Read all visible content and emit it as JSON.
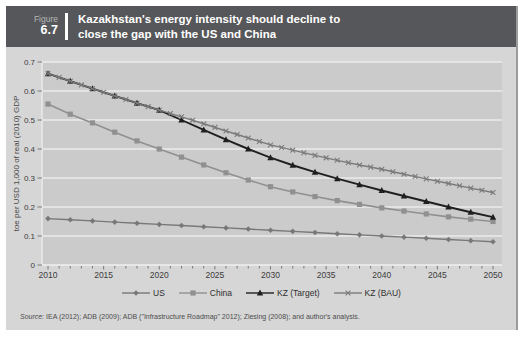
{
  "header": {
    "figure_label": "Figure",
    "figure_number": "6.7",
    "title_line1": "Kazakhstan's energy intensity should decline to",
    "title_line2": "close the gap with the US and China",
    "header_bg": "#56575a"
  },
  "source_note": {
    "prefix": "Source:",
    "text": " IEA (2012); ADB (2009); ADB (\"Infrastructure Roadmap\" 2012); Ziesing (2008); and author's analysis."
  },
  "colors": {
    "body_bg": "#d6d6d6",
    "plot_bg": "#cbcbcb",
    "gridline": "#ebebeb",
    "axis_line": "#efefef",
    "tick_mark": "#6f6f6f"
  },
  "chart_data": {
    "type": "line",
    "title": "Kazakhstan's energy intensity should decline to close the gap with the US and China",
    "xlabel": "",
    "ylabel": "toe per  USD 1,000 of real (2010) GDP",
    "xlim": [
      2010,
      2050
    ],
    "ylim": [
      0,
      0.7
    ],
    "x_ticks": [
      2010,
      2015,
      2020,
      2025,
      2030,
      2035,
      2040,
      2045,
      2050
    ],
    "y_ticks": [
      0,
      0.1,
      0.2,
      0.3,
      0.4,
      0.5,
      0.6,
      0.7
    ],
    "grid": "horizontal",
    "legend_position": "bottom",
    "x": [
      2010,
      2012,
      2014,
      2016,
      2018,
      2020,
      2022,
      2024,
      2026,
      2028,
      2030,
      2032,
      2034,
      2036,
      2038,
      2040,
      2042,
      2044,
      2046,
      2048,
      2050
    ],
    "series": [
      {
        "name": "US",
        "marker": "diamond",
        "color": "#787878",
        "values": [
          0.16,
          0.156,
          0.152,
          0.148,
          0.144,
          0.14,
          0.136,
          0.132,
          0.128,
          0.124,
          0.12,
          0.116,
          0.112,
          0.108,
          0.104,
          0.1,
          0.096,
          0.092,
          0.088,
          0.084,
          0.08
        ]
      },
      {
        "name": "China",
        "marker": "square",
        "color": "#909090",
        "values": [
          0.555,
          0.52,
          0.49,
          0.458,
          0.428,
          0.4,
          0.372,
          0.345,
          0.318,
          0.293,
          0.27,
          0.252,
          0.236,
          0.222,
          0.209,
          0.197,
          0.186,
          0.176,
          0.166,
          0.158,
          0.15
        ]
      },
      {
        "name": "KZ (Target)",
        "marker": "triangle",
        "color": "#1f1f1f",
        "values": [
          0.66,
          0.634,
          0.608,
          0.583,
          0.558,
          0.534,
          0.5,
          0.466,
          0.432,
          0.4,
          0.37,
          0.344,
          0.32,
          0.298,
          0.277,
          0.257,
          0.238,
          0.219,
          0.2,
          0.182,
          0.165
        ]
      },
      {
        "name": "KZ (BAU)",
        "marker": "x",
        "color": "#7a7a7a",
        "values": [
          0.66,
          0.634,
          0.608,
          0.583,
          0.558,
          0.534,
          0.511,
          0.487,
          0.462,
          0.438,
          0.414,
          0.396,
          0.378,
          0.361,
          0.345,
          0.33,
          0.313,
          0.297,
          0.281,
          0.265,
          0.25
        ]
      }
    ]
  }
}
